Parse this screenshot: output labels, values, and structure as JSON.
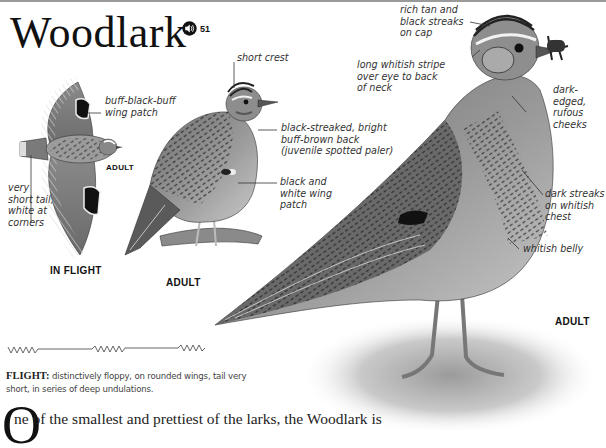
{
  "page": {
    "title": "Woodlark",
    "audio": {
      "icon": "speaker-icon",
      "track_number": "51"
    }
  },
  "illustrations": {
    "in_flight": {
      "caption": "IN FLIGHT",
      "sub_caption": "ADULT",
      "labels": {
        "wing_patch": "buff-black-buff\nwing patch",
        "tail": "very\nshort tail,\nwhite at\ncorners"
      }
    },
    "perched": {
      "caption": "ADULT",
      "labels": {
        "crest": "short crest",
        "back": "black-streaked, bright\nbuff-brown back\n(juvenile spotted paler)",
        "wing": "black and\nwhite wing\npatch"
      }
    },
    "standing": {
      "caption": "ADULT",
      "labels": {
        "cap": "rich tan and\nblack streaks\non cap",
        "stripe": "long whitish stripe\nover eye to back\nof neck",
        "cheeks": "dark-\nedged,\nrufous\ncheeks",
        "chest": "dark streaks\non whitish\nchest",
        "belly": "whitish belly"
      }
    }
  },
  "flight": {
    "heading": "FLIGHT:",
    "description": "distinctively floppy, on rounded wings, tail very short, in series of deep undulations."
  },
  "body": {
    "drop_cap": "O",
    "text": "ne of the smallest and prettiest of the larks, the Woodlark is"
  }
}
